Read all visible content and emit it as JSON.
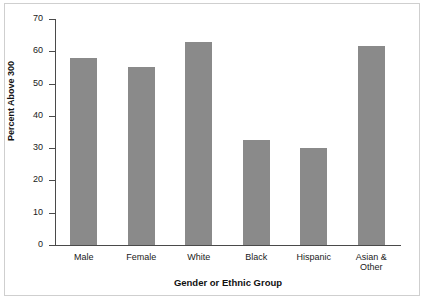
{
  "chart_data": {
    "type": "bar",
    "title": "",
    "subtitle": "",
    "xlabel": "Gender or Ethnic Group",
    "ylabel": "Percent Above 300",
    "categories": [
      "Male",
      "Female",
      "White",
      "Black",
      "Hispanic",
      "Asian &\nOther"
    ],
    "values": [
      58,
      55,
      63,
      32.5,
      30,
      61.5
    ],
    "ylim": [
      0,
      70
    ],
    "yticks": [
      0,
      10,
      20,
      30,
      40,
      50,
      60,
      70
    ],
    "ytick_labels": [
      "0",
      "10",
      "20",
      "30",
      "40",
      "50",
      "60",
      "70"
    ],
    "grid": false,
    "legend": null,
    "bar_color": "#8a8a8a",
    "axis_color": "#4a4a4a",
    "background_color": "#ffffff",
    "frame_color": "#cfcfcf"
  },
  "figure": {
    "border_label": "chart-frame"
  }
}
